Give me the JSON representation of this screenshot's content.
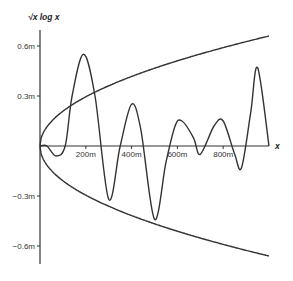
{
  "chart_data": {
    "type": "line",
    "title": "",
    "ylabel": "√x log x",
    "xlabel": "x",
    "xlim": [
      0,
      1000
    ],
    "ylim": [
      -0.7,
      0.7
    ],
    "x_unit": "m",
    "y_unit": "m",
    "grid": false,
    "legend": null,
    "x_ticks": [
      {
        "value": 200,
        "label": "200m"
      },
      {
        "value": 400,
        "label": "400m"
      },
      {
        "value": 600,
        "label": "600m"
      },
      {
        "value": 800,
        "label": "800m"
      }
    ],
    "y_ticks": [
      {
        "value": 0.6,
        "label": "0.6m"
      },
      {
        "value": 0.3,
        "label": "0.3m"
      },
      {
        "value": -0.3,
        "label": "−0.3m"
      },
      {
        "value": -0.6,
        "label": "−0.6m"
      }
    ],
    "series": [
      {
        "name": "upper envelope",
        "x": [
          0,
          50,
          100,
          200,
          300,
          400,
          500,
          600,
          700,
          800,
          900,
          1000
        ],
        "y": [
          0,
          0.15,
          0.21,
          0.3,
          0.36,
          0.42,
          0.47,
          0.51,
          0.55,
          0.59,
          0.63,
          0.66
        ]
      },
      {
        "name": "lower envelope",
        "x": [
          0,
          50,
          100,
          200,
          300,
          400,
          500,
          600,
          700,
          800,
          900,
          1000
        ],
        "y": [
          0,
          -0.15,
          -0.21,
          -0.3,
          -0.36,
          -0.42,
          -0.47,
          -0.51,
          -0.55,
          -0.59,
          -0.63,
          -0.66
        ]
      },
      {
        "name": "oscillating signal",
        "x": [
          0,
          30,
          70,
          110,
          140,
          190,
          240,
          300,
          350,
          400,
          440,
          500,
          550,
          590,
          620,
          670,
          700,
          760,
          800,
          850,
          880,
          920,
          950,
          1000
        ],
        "y": [
          0,
          0,
          -0.06,
          0,
          0.3,
          0.55,
          0.3,
          -0.32,
          0,
          0.25,
          0.1,
          -0.44,
          -0.1,
          0.12,
          0.15,
          0.05,
          -0.05,
          0.12,
          0.15,
          -0.05,
          -0.13,
          0.2,
          0.47,
          0
        ]
      }
    ]
  }
}
